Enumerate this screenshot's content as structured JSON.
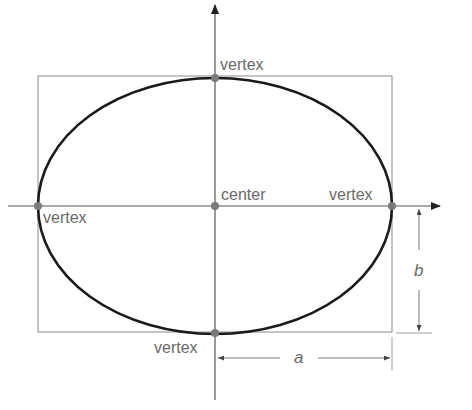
{
  "diagram": {
    "type": "ellipse-anatomy",
    "labels": {
      "top_vertex": "vertex",
      "bottom_vertex": "vertex",
      "left_vertex": "vertex",
      "right_vertex": "vertex",
      "center": "center",
      "semi_major": "a",
      "semi_minor": "b"
    },
    "colors": {
      "ellipse": "#1a1a1a",
      "axes": "#555555",
      "box": "#8a8a8a",
      "points": "#7a7a7a",
      "text": "#6a6a6a"
    }
  }
}
